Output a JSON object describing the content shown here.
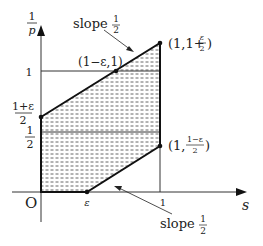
{
  "diagram": {
    "axes": {
      "y_label_num": "1",
      "y_label_den": "p",
      "x_label": "s",
      "origin": "O"
    },
    "y_ticks": {
      "one": "1",
      "half_num": "1",
      "half_den": "2",
      "one_plus_eps_num": "1+ε",
      "one_plus_eps_den": "2"
    },
    "x_ticks": {
      "eps": "ε",
      "one": "1"
    },
    "points": {
      "top_right": "(1,1+",
      "top_right_frac_num": "ε",
      "top_right_frac_den": "2",
      "top_right_close": ")",
      "upper_mid": "(1−ε,1)",
      "lower_right": "(1,",
      "lower_right_frac_num": "1−ε",
      "lower_right_frac_den": "2",
      "lower_right_close": ")"
    },
    "annotations": {
      "slope_top": "slope",
      "slope_top_num": "1",
      "slope_top_den": "2",
      "slope_bottom": "slope",
      "slope_bottom_num": "1",
      "slope_bottom_den": "2"
    },
    "colors": {
      "line": "#111111",
      "hatch": "#555555",
      "text": "#222222"
    }
  }
}
